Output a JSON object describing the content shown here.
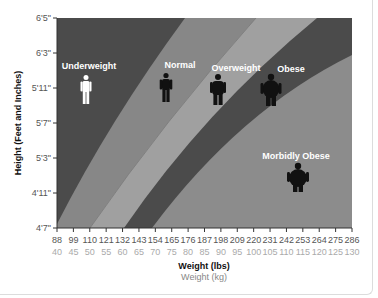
{
  "chart_data": {
    "type": "area",
    "title": "",
    "xlabel": "Weight (lbs)",
    "xlabel_secondary": "Weight (kg)",
    "ylabel": "Height (Feet and Inches)",
    "x_ticks_lbs": [
      "88",
      "99",
      "110",
      "121",
      "132",
      "143",
      "154",
      "165",
      "176",
      "187",
      "198",
      "209",
      "220",
      "231",
      "242",
      "253",
      "264",
      "275",
      "286"
    ],
    "x_ticks_kg": [
      "40",
      "45",
      "50",
      "55",
      "60",
      "65",
      "70",
      "75",
      "80",
      "85",
      "90",
      "95",
      "100",
      "105",
      "110",
      "115",
      "120",
      "125",
      "130"
    ],
    "y_ticks": [
      "6'5\"",
      "6'3\"",
      "5'11\"",
      "5'7\"",
      "5'3\"",
      "4'11\"",
      "4'7\""
    ],
    "xlim_lbs": [
      88,
      286
    ],
    "ylim": [
      "4'7\"",
      "6'5\""
    ],
    "categories": [
      {
        "name": "Underweight",
        "color": "#4b4b4b",
        "label_color": "#ffffff",
        "figure_color": "#ffffff"
      },
      {
        "name": "Normal",
        "color": "#878787",
        "label_color": "#ffffff",
        "figure_color": "#111111"
      },
      {
        "name": "Overweight",
        "color": "#a0a0a0",
        "label_color": "#ffffff",
        "figure_color": "#111111"
      },
      {
        "name": "Obese",
        "color": "#4b4b4b",
        "label_color": "#ffffff",
        "figure_color": "#111111"
      },
      {
        "name": "Morbidly Obese",
        "color": "#8c8c8c",
        "label_color": "#ffffff",
        "figure_color": "#111111"
      }
    ],
    "grid": false,
    "legend": "inline labels"
  }
}
